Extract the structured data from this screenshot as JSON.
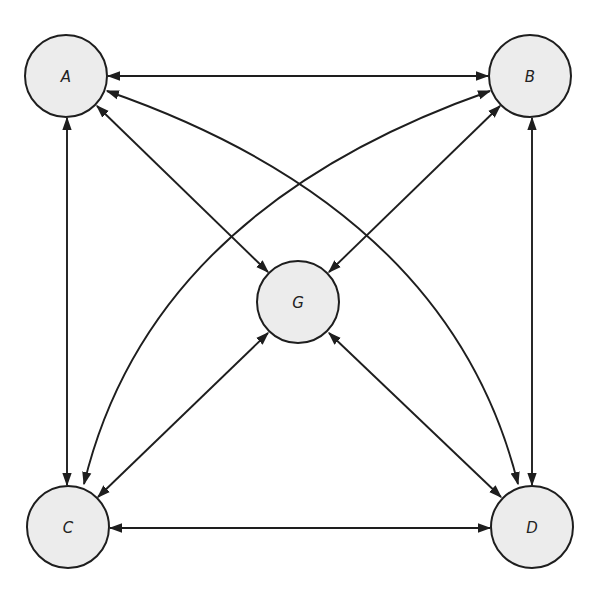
{
  "diagram": {
    "type": "complete-graph",
    "colors": {
      "node_fill": "#ececec",
      "stroke": "#1e1e1e",
      "label": "#222222",
      "background": "#ffffff"
    },
    "nodes": [
      {
        "id": "A",
        "label": "A",
        "cx": 66,
        "cy": 76,
        "r": 41
      },
      {
        "id": "B",
        "label": "B",
        "cx": 530,
        "cy": 76,
        "r": 41
      },
      {
        "id": "C",
        "label": "C",
        "cx": 68,
        "cy": 527,
        "r": 41
      },
      {
        "id": "D",
        "label": "D",
        "cx": 532,
        "cy": 527,
        "r": 41
      },
      {
        "id": "G",
        "label": "G",
        "cx": 298,
        "cy": 302,
        "r": 41
      }
    ],
    "edges": [
      {
        "from": "A",
        "to": "B",
        "shape": "straight",
        "direction": "bidirectional"
      },
      {
        "from": "C",
        "to": "D",
        "shape": "straight",
        "direction": "bidirectional"
      },
      {
        "from": "A",
        "to": "C",
        "shape": "straight",
        "direction": "bidirectional"
      },
      {
        "from": "B",
        "to": "D",
        "shape": "straight",
        "direction": "bidirectional"
      },
      {
        "from": "A",
        "to": "G",
        "shape": "straight",
        "direction": "bidirectional"
      },
      {
        "from": "B",
        "to": "G",
        "shape": "straight",
        "direction": "bidirectional"
      },
      {
        "from": "C",
        "to": "G",
        "shape": "straight",
        "direction": "bidirectional"
      },
      {
        "from": "D",
        "to": "G",
        "shape": "straight",
        "direction": "bidirectional"
      },
      {
        "from": "A",
        "to": "D",
        "shape": "curved",
        "direction": "bidirectional"
      },
      {
        "from": "B",
        "to": "C",
        "shape": "curved",
        "direction": "bidirectional"
      }
    ]
  }
}
